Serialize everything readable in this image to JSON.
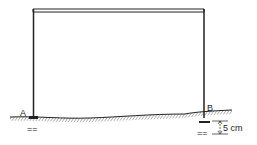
{
  "diagram": {
    "type": "portal-frame-settlement",
    "support_a": {
      "label": "A"
    },
    "support_b": {
      "label": "B"
    },
    "settlement": {
      "label": "5 cm"
    },
    "fixed_marks": {
      "a": "==",
      "b": "=="
    },
    "colors": {
      "line": "#222222",
      "background": "#ffffff"
    }
  }
}
